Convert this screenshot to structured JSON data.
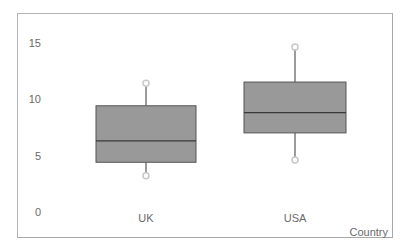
{
  "chart_data": {
    "type": "boxplot",
    "title": "",
    "xlabel": "Country",
    "ylabel": "",
    "categories": [
      "UK",
      "USA"
    ],
    "boxes": [
      {
        "name": "UK",
        "whisker_low": 3.2,
        "q1": 4.4,
        "median": 6.3,
        "q3": 9.4,
        "whisker_high": 11.4
      },
      {
        "name": "USA",
        "whisker_low": 4.6,
        "q1": 7.0,
        "median": 8.8,
        "q3": 11.5,
        "whisker_high": 14.6
      }
    ],
    "yticks": [
      0,
      5,
      10,
      15
    ],
    "ylim": [
      0,
      17
    ],
    "grid": false,
    "legend": null,
    "colors": {
      "box_fill": "#999999",
      "box_edge": "#555555",
      "whisker": "#666666",
      "cap_marker": "#c8c8c8"
    }
  },
  "axis": {
    "y_ticks": [
      {
        "label": "15",
        "value": 15
      },
      {
        "label": "10",
        "value": 10
      },
      {
        "label": "5",
        "value": 5
      },
      {
        "label": "0",
        "value": 0
      }
    ],
    "x_label": "Country"
  }
}
